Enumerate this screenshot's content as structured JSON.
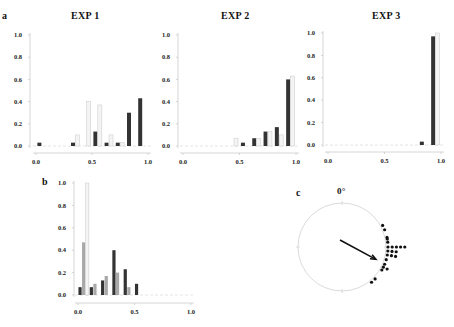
{
  "panels": {
    "a": {
      "label": "a"
    },
    "b": {
      "label": "b"
    },
    "c": {
      "label": "c",
      "zero_label": "0°"
    }
  },
  "colors": {
    "dark": "#333333",
    "gray": "#a8a8a8",
    "light": "#f4f4f4",
    "light_stroke": "#cfcfcf",
    "axis": "#cccccc"
  },
  "chart_data": [
    {
      "type": "bar",
      "title": "EXP 1",
      "panel": "a",
      "bins": [
        0.05,
        0.15,
        0.25,
        0.35,
        0.45,
        0.55,
        0.65,
        0.75,
        0.85,
        0.95
      ],
      "x_ticks": [
        "0.0",
        "0.5",
        "1.0"
      ],
      "y_ticks": [
        "0.0",
        "0.2",
        "0.4",
        "0.6",
        "0.8",
        "1.0"
      ],
      "xlim": [
        0,
        1
      ],
      "ylim": [
        0,
        1
      ],
      "series": [
        {
          "name": "dark",
          "values": [
            0.03,
            0,
            0,
            0.03,
            0,
            0.13,
            0.03,
            0.03,
            0.3,
            0.43
          ]
        },
        {
          "name": "light",
          "values": [
            0,
            0,
            0,
            0.1,
            0.4,
            0.37,
            0.1,
            0.03,
            0,
            0
          ]
        }
      ]
    },
    {
      "type": "bar",
      "title": "EXP 2",
      "panel": "a",
      "bins": [
        0.05,
        0.15,
        0.25,
        0.35,
        0.45,
        0.55,
        0.65,
        0.75,
        0.85,
        0.95
      ],
      "x_ticks": [
        "0.0",
        "0.5",
        "1.0"
      ],
      "y_ticks": [
        "0.0",
        "0.2",
        "0.4",
        "0.6",
        "0.8",
        "1.0"
      ],
      "xlim": [
        0,
        1
      ],
      "ylim": [
        0,
        1
      ],
      "series": [
        {
          "name": "dark",
          "values": [
            0,
            0,
            0,
            0,
            0,
            0.03,
            0.07,
            0.13,
            0.17,
            0.6
          ]
        },
        {
          "name": "light",
          "values": [
            0,
            0,
            0,
            0,
            0.07,
            0,
            0.07,
            0.13,
            0.1,
            0.63
          ]
        }
      ]
    },
    {
      "type": "bar",
      "title": "EXP 3",
      "panel": "a",
      "bins": [
        0.05,
        0.15,
        0.25,
        0.35,
        0.45,
        0.55,
        0.65,
        0.75,
        0.85,
        0.95
      ],
      "x_ticks": [
        "0.0",
        "0.5",
        "1.0"
      ],
      "y_ticks": [
        "0.0",
        "0.2",
        "0.4",
        "0.6",
        "0.8",
        "1.0"
      ],
      "xlim": [
        0,
        1
      ],
      "ylim": [
        0,
        1
      ],
      "series": [
        {
          "name": "dark",
          "values": [
            0,
            0,
            0,
            0,
            0,
            0,
            0,
            0,
            0.03,
            0.97
          ]
        },
        {
          "name": "light",
          "values": [
            0,
            0,
            0,
            0,
            0,
            0,
            0,
            0,
            0,
            1.0
          ]
        }
      ]
    },
    {
      "type": "bar",
      "title": "",
      "panel": "b",
      "bins": [
        0.05,
        0.15,
        0.25,
        0.35,
        0.45,
        0.55,
        0.65,
        0.75,
        0.85,
        0.95
      ],
      "x_ticks": [
        "0.0",
        "0.5",
        "1.0"
      ],
      "y_ticks": [
        "0.0",
        "0.2",
        "0.4",
        "0.6",
        "0.8",
        "1.0"
      ],
      "xlim": [
        0,
        1
      ],
      "ylim": [
        0,
        1
      ],
      "series": [
        {
          "name": "dark",
          "values": [
            0.07,
            0.07,
            0.13,
            0.4,
            0.23,
            0.1,
            0,
            0,
            0,
            0
          ]
        },
        {
          "name": "gray",
          "values": [
            0.47,
            0.1,
            0.17,
            0.2,
            0.07,
            0,
            0,
            0,
            0,
            0
          ]
        },
        {
          "name": "light",
          "values": [
            1.0,
            0,
            0,
            0,
            0,
            0,
            0,
            0,
            0,
            0
          ]
        }
      ]
    },
    {
      "type": "scatter",
      "subtype": "circular",
      "panel": "c",
      "title": "",
      "zero_label": "0°",
      "mean_vector": {
        "angle_deg": 110,
        "length": 0.82
      },
      "points_deg": [
        62,
        68,
        78,
        80,
        84,
        90,
        90,
        90,
        90,
        90,
        95,
        95,
        95,
        100,
        100,
        100,
        106,
        112,
        116,
        116,
        120,
        134,
        140
      ]
    }
  ]
}
